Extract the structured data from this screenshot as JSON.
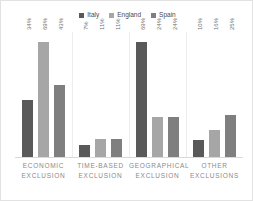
{
  "legend": {
    "position": "top-center",
    "entries": [
      {
        "label": "Italy",
        "color": "#595959"
      },
      {
        "label": "England",
        "color": "#a6a6a6"
      },
      {
        "label": "Spain",
        "color": "#7f7f7f"
      }
    ]
  },
  "chart_data": {
    "type": "bar",
    "title": "",
    "subtitle": "",
    "xlabel": "",
    "ylabel": "",
    "grid": false,
    "ylim": [
      0,
      75
    ],
    "legend_position": "top-center",
    "categories": [
      "ECONOMIC EXCLUSION",
      "TIME-BASED EXCLUSION",
      "GEOGRAPHICAL EXCLUSION",
      "OTHER EXCLUSIONS"
    ],
    "series": [
      {
        "name": "Italy",
        "color": "#595959",
        "values": [
          34,
          7,
          69,
          10
        ],
        "labels": [
          "34%",
          "7%",
          "69%",
          "10%"
        ]
      },
      {
        "name": "England",
        "color": "#a6a6a6",
        "values": [
          69,
          11,
          24,
          16
        ],
        "labels": [
          "69%",
          "11%",
          "24%",
          "16%"
        ]
      },
      {
        "name": "Spain",
        "color": "#7f7f7f",
        "values": [
          43,
          11,
          24,
          25
        ],
        "labels": [
          "43%",
          "11%",
          "24%",
          "25%"
        ]
      }
    ]
  },
  "categories_display": [
    {
      "line1": "ECONOMIC",
      "line2": "EXCLUSION"
    },
    {
      "line1": "TIME-BASED",
      "line2": "EXCLUSION"
    },
    {
      "line1": "GEOGRAPHICAL",
      "line2": "EXCLUSION"
    },
    {
      "line1": "OTHER",
      "line2": "EXCLUSIONS"
    }
  ],
  "style": {
    "background": "#ffffff",
    "border_color": "#e2e2e2",
    "axis_color": "#d9d9d9",
    "separator_color": "#ededed",
    "label_color": "#8a8a8a",
    "value_color": "#707070"
  }
}
